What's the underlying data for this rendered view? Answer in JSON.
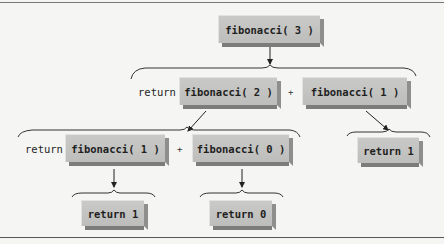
{
  "diagram": {
    "type": "recursion-tree",
    "root": {
      "label": "fibonacci( 3 )"
    },
    "level2": {
      "return_keyword": "return",
      "left": {
        "label": "fibonacci( 2 )"
      },
      "operator": "+",
      "right": {
        "label": "fibonacci( 1 )"
      }
    },
    "level3": {
      "return_keyword": "return",
      "left": {
        "label": "fibonacci( 1 )"
      },
      "operator": "+",
      "right": {
        "label": "fibonacci( 0 )"
      },
      "side_result": {
        "label": "return 1"
      }
    },
    "level4": {
      "left_result": {
        "label": "return 1"
      },
      "right_result": {
        "label": "return 0"
      }
    },
    "colors": {
      "box_fill": "#c4c4c2",
      "box_shadow": "#858583",
      "line": "#333333",
      "background": "#f5f5f3"
    }
  }
}
